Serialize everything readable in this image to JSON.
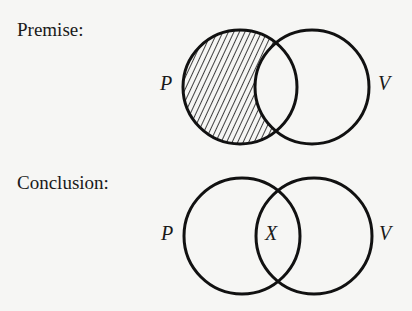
{
  "premise": {
    "heading": "Premise:",
    "circles": [
      {
        "label": "P",
        "cx": 240,
        "cy": 87,
        "r": 57
      },
      {
        "label": "V",
        "cx": 312,
        "cy": 87,
        "r": 57
      }
    ],
    "shaded_region": "P only (P outside V), diagonal hatching"
  },
  "conclusion": {
    "heading": "Conclusion:",
    "circles": [
      {
        "label": "P",
        "cx": 242,
        "cy": 236,
        "r": 58
      },
      {
        "label": "V",
        "cx": 314,
        "cy": 236,
        "r": 58
      }
    ],
    "intersection_mark": "X"
  },
  "colors": {
    "stroke": "#111111",
    "background": "#f6f6f4"
  }
}
